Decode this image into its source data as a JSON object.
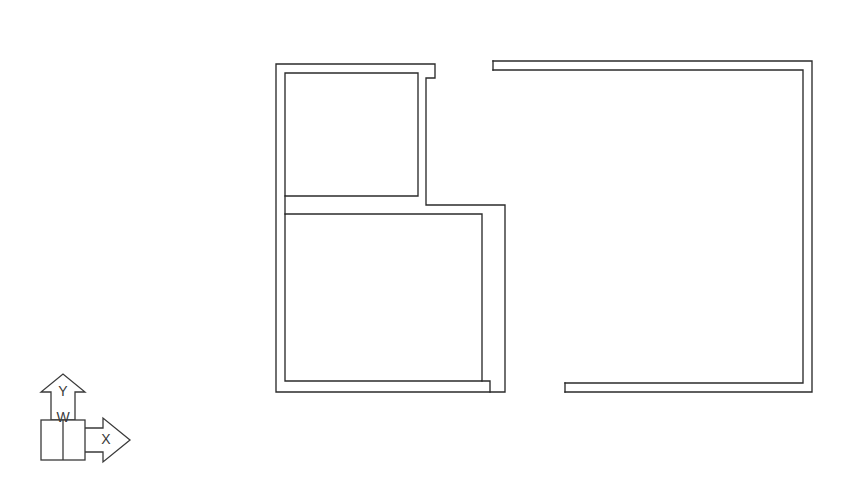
{
  "drawing": {
    "type": "architectural-floor-plan",
    "background_color": "#ffffff",
    "wall_color": "#2b2b2b",
    "axis_color": "#3a3a3a",
    "wall_thickness_px": 9,
    "line_width_px": 1.35
  },
  "axis_indicator": {
    "name": "xy-axis-indicator",
    "origin_label": "W",
    "vertical_axis_label": "Y",
    "horizontal_axis_label": "X",
    "vertical_direction": "up",
    "horizontal_direction": "right",
    "origin_box": {
      "x": 41,
      "y": 420,
      "width": 44,
      "height": 40
    }
  },
  "rooms": [
    {
      "name": "upper-left-room",
      "outer": {
        "x": 276,
        "y": 64,
        "width": 159,
        "height": 141
      },
      "inner": {
        "x": 285,
        "y": 73,
        "width": 133,
        "height": 123
      }
    },
    {
      "name": "lower-left-room",
      "outer": {
        "x": 276,
        "y": 205,
        "width": 229,
        "height": 193
      },
      "inner": {
        "x": 285,
        "y": 214,
        "width": 197,
        "height": 167
      }
    },
    {
      "name": "right-room",
      "outer": {
        "x": 493,
        "y": 61,
        "width": 319,
        "height": 331
      },
      "inner": {
        "x": 565,
        "y": 70,
        "width": 238,
        "height": 313
      },
      "open_side": "left"
    }
  ],
  "openings": [
    {
      "name": "opening-between-left-rooms-right-side",
      "orientation": "vertical",
      "x": 430,
      "y_start": 196,
      "y_end": 205
    },
    {
      "name": "opening-right-room-top-left",
      "orientation": "horizontal",
      "y": 61,
      "x_start": 435,
      "x_end": 493
    },
    {
      "name": "opening-right-room-left-wall",
      "orientation": "vertical",
      "x": 493,
      "y_start": 70,
      "y_end": 383
    },
    {
      "name": "opening-right-room-bottom-left",
      "orientation": "horizontal",
      "y": 392,
      "x_start": 505,
      "x_end": 565
    }
  ],
  "wall_paths": {
    "left_structure_outer": "M 276 64 L 435 64 L 435 78 L 426 78 L 426 205 L 505 205 L 505 392 L 276 392 Z",
    "left_structure_inner_upper": "M 285 73 L 418 73 L 418 196 L 285 196 Z",
    "left_structure_inner_lower": "M 285 214 L 482 214 L 482 381 L 285 381 Z",
    "left_structure_step_cap": "M 490 381 L 490 392",
    "right_room_outer": "M 493 61 L 812 61 L 812 392 L 565 392",
    "right_room_inner": "M 493 70 L 803 70 L 803 383 L 565 383",
    "right_room_cap_top": "M 493 61 L 493 70",
    "right_room_cap_bottom": "M 565 383 L 565 392"
  }
}
